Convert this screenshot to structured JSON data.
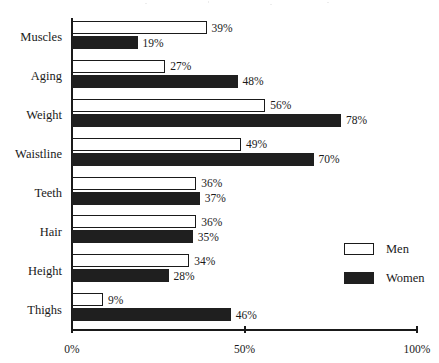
{
  "chart_data": {
    "type": "bar",
    "orientation": "horizontal",
    "title": "",
    "subtitle": "",
    "xlabel": "",
    "ylabel": "",
    "xlim": [
      0,
      100
    ],
    "xticks": [
      "0%",
      "50%",
      "100%"
    ],
    "xtick_values": [
      0,
      50,
      100
    ],
    "grid": false,
    "legend_position": "bottom-right",
    "value_suffix": "%",
    "categories": [
      "Muscles",
      "Aging",
      "Weight",
      "Waistline",
      "Teeth",
      "Hair",
      "Height",
      "Thighs"
    ],
    "series": [
      {
        "name": "Men",
        "style": "outlined",
        "color": "#ffffff",
        "edge_color": "#1a1a1a",
        "values": [
          39,
          27,
          56,
          49,
          36,
          36,
          34,
          9
        ],
        "labels": [
          "39%",
          "27%",
          "56%",
          "49%",
          "36%",
          "36%",
          "34%",
          "9%"
        ]
      },
      {
        "name": "Women",
        "style": "filled",
        "color": "#1f1f1f",
        "edge_color": "#1f1f1f",
        "values": [
          19,
          48,
          78,
          70,
          37,
          35,
          28,
          46
        ],
        "labels": [
          "19%",
          "48%",
          "78%",
          "70%",
          "37%",
          "35%",
          "28%",
          "46%"
        ]
      }
    ]
  },
  "legend": {
    "items": [
      {
        "label": "Men",
        "swatch": "outlined-square-icon"
      },
      {
        "label": "Women",
        "swatch": "filled-square-icon"
      }
    ]
  }
}
